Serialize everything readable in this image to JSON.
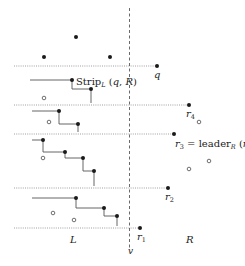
{
  "diagram": {
    "divider": {
      "x": 129.5,
      "y1": 8,
      "y2": 250,
      "label": "v",
      "label_x": 128,
      "label_y": 254
    },
    "region_labels": [
      {
        "id": "L",
        "text": "L",
        "x": 70,
        "y": 243
      },
      {
        "id": "R",
        "text": "R",
        "x": 186,
        "y": 243
      }
    ],
    "strip_lines": [
      {
        "y": 66,
        "x1": 14,
        "x2": 157
      },
      {
        "y": 105,
        "x1": 14,
        "x2": 189
      },
      {
        "y": 134,
        "x1": 14,
        "x2": 174
      },
      {
        "y": 188,
        "x1": 14,
        "x2": 168
      },
      {
        "y": 228,
        "x1": 14,
        "x2": 140
      }
    ],
    "filled_points_left": [
      [
        76,
        37
      ],
      [
        44,
        57
      ],
      [
        110,
        57
      ],
      [
        72,
        80
      ],
      [
        91,
        89
      ],
      [
        59,
        111
      ],
      [
        78,
        124
      ],
      [
        43,
        140
      ],
      [
        65,
        152
      ],
      [
        83,
        158
      ],
      [
        94,
        171
      ],
      [
        76,
        198
      ],
      [
        104,
        208
      ],
      [
        117,
        216
      ]
    ],
    "hollow_points_left": [
      [
        44,
        98
      ],
      [
        49,
        122
      ],
      [
        43,
        158
      ],
      [
        53,
        213
      ],
      [
        74,
        220
      ]
    ],
    "right_points": [
      {
        "id": "q",
        "x": 157,
        "y": 66,
        "label": "q",
        "label_x": 154,
        "label_y": 78
      },
      {
        "id": "r4",
        "x": 189,
        "y": 105,
        "label": "r",
        "sub": "4",
        "label_x": 186,
        "label_y": 117
      },
      {
        "id": "r3",
        "x": 174,
        "y": 134,
        "label": "r",
        "sub": "3",
        "label_x": 174,
        "label_y": 147
      },
      {
        "id": "r2",
        "x": 168,
        "y": 188,
        "label": "r",
        "sub": "2",
        "label_x": 165,
        "label_y": 200
      },
      {
        "id": "r1",
        "x": 140,
        "y": 228,
        "label": "r",
        "sub": "1",
        "label_x": 137,
        "label_y": 240
      }
    ],
    "hollow_points_right": [
      [
        199,
        122
      ],
      [
        189,
        169
      ],
      [
        209,
        161
      ]
    ],
    "staircases": [
      {
        "start_x": 30,
        "points": [
          [
            72,
            80
          ],
          [
            91,
            89
          ]
        ],
        "end_y": 103
      },
      {
        "start_x": 32,
        "points": [
          [
            59,
            111
          ],
          [
            78,
            124
          ]
        ],
        "end_y": 132
      },
      {
        "start_x": 32,
        "points": [
          [
            43,
            140
          ],
          [
            65,
            152
          ],
          [
            83,
            158
          ],
          [
            94,
            171
          ]
        ],
        "end_y": 186
      },
      {
        "start_x": 32,
        "points": [
          [
            76,
            198
          ],
          [
            104,
            208
          ],
          [
            117,
            216
          ]
        ],
        "end_y": 226
      }
    ],
    "annotations": {
      "strip": {
        "text": "Strip",
        "sub": "L",
        "args": " (q, R)",
        "x": 76,
        "y": 85
      },
      "leader": {
        "prefix": "r",
        "prefix_sub": "3",
        "eq": " = leader",
        "sub": "R",
        "args": " (r",
        "args_sub": "4",
        "close": ")",
        "x": 175,
        "y": 147
      }
    },
    "colors": {
      "ink": "#1a1a1a",
      "stair": "#555555",
      "dotted": "#888888"
    }
  }
}
